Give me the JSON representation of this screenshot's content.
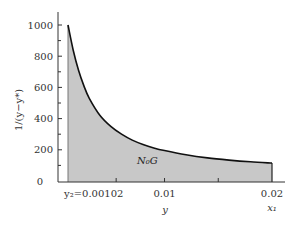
{
  "chart_data": {
    "type": "area",
    "title": "",
    "xlabel": "y",
    "ylabel": "1/(y−y*)",
    "x_tick_labels": [
      {
        "value": 0.00102,
        "label": "y₂=0.00102",
        "mark": false
      },
      {
        "value": 0.01,
        "label": "0.01",
        "mark": true
      },
      {
        "value": 0.02,
        "label": "0.02",
        "mark": false
      }
    ],
    "x_minor_ticks": [
      0.0055,
      0.015
    ],
    "x_end_label": "x₁",
    "y_ticks": [
      0,
      200,
      400,
      600,
      800,
      1000
    ],
    "y_tick_labels": [
      "0",
      "200",
      "400",
      "600",
      "800",
      "1000"
    ],
    "xlim": [
      0,
      0.0205
    ],
    "ylim": [
      0,
      1080
    ],
    "grid": false,
    "shaded_label": "N₀G",
    "series": [
      {
        "name": "1/(y−y*)",
        "x": [
          0.00102,
          0.0015,
          0.002,
          0.0025,
          0.003,
          0.004,
          0.005,
          0.006,
          0.007,
          0.008,
          0.009,
          0.01,
          0.012,
          0.014,
          0.016,
          0.018,
          0.02
        ],
        "y": [
          1000,
          840,
          710,
          610,
          530,
          420,
          350,
          300,
          262,
          234,
          212,
          195,
          168,
          148,
          134,
          123,
          115
        ]
      }
    ],
    "fill_color": "#c8c8c8",
    "line_color": "#111111"
  }
}
